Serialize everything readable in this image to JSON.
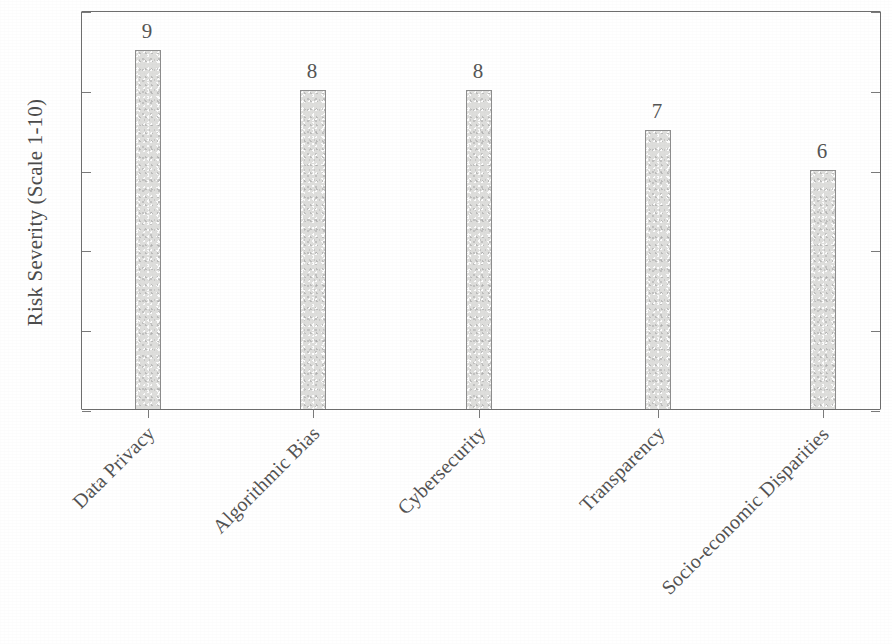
{
  "chart_data": {
    "type": "bar",
    "title": "",
    "subtitle": "",
    "xlabel": "",
    "ylabel": "Risk Severity (Scale 1-10)",
    "categories": [
      "Data Privacy",
      "Algorithmic Bias",
      "Cybersecurity",
      "Transparency",
      "Socio-economic Disparities"
    ],
    "values": [
      9,
      8,
      8,
      7,
      6
    ],
    "value_labels": [
      "9",
      "8",
      "8",
      "7",
      "6"
    ],
    "ylim": [
      0,
      10
    ],
    "yticks": [
      0,
      2,
      4,
      6,
      8,
      10
    ],
    "ytick_labels": [
      "0",
      "2",
      "4",
      "6",
      "8",
      "10"
    ],
    "xtick_label_rotation": -45,
    "grid": false,
    "legend": null,
    "legend_position": "none",
    "bar_fill_color": "#dededc",
    "bar_edge_color": "#8d8d8d",
    "axis_color": "#6e6e6e",
    "text_color": "#4f4f4f",
    "background_color": "#ffffff"
  }
}
